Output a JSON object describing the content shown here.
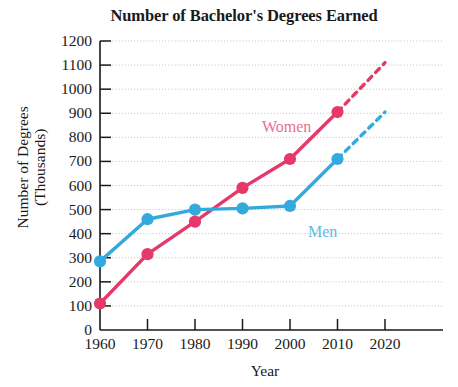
{
  "chart_data": {
    "type": "line",
    "title": "Number of Bachelor's Degrees Earned",
    "xlabel": "Year",
    "ylabel": "Number of Degrees\n(Thousands)",
    "ylabel_line1": "Number of Degrees",
    "ylabel_line2": "(Thousands)",
    "x": [
      1960,
      1970,
      1980,
      1990,
      2000,
      2010,
      2020
    ],
    "categories": [
      "1960",
      "1970",
      "1980",
      "1990",
      "2000",
      "2010",
      "2020"
    ],
    "xlim": [
      1960,
      2020
    ],
    "ylim": [
      0,
      1200
    ],
    "ytick_labels": [
      "0",
      "100",
      "200",
      "300",
      "400",
      "500",
      "600",
      "700",
      "800",
      "900",
      "1000",
      "1100",
      "1200"
    ],
    "ytick_values": [
      0,
      100,
      200,
      300,
      400,
      500,
      600,
      700,
      800,
      900,
      1000,
      1100,
      1200
    ],
    "xtick_labels": [
      "1960",
      "1970",
      "1980",
      "1990",
      "2000",
      "2010",
      "2020"
    ],
    "grid": "horizontal-dotted",
    "legend": "inline-series-labels",
    "series": [
      {
        "name": "Women",
        "color": "#e5396a",
        "dash_color": "#e5396a",
        "label_color": "#e8708f",
        "x": [
          1960,
          1970,
          1980,
          1990,
          2000,
          2010
        ],
        "values": [
          110,
          315,
          450,
          590,
          710,
          905
        ],
        "projected_x": [
          2010,
          2020
        ],
        "projected_values": [
          905,
          1110
        ],
        "projected_style": "dashed"
      },
      {
        "name": "Men",
        "color": "#34aadc",
        "dash_color": "#34aadc",
        "label_color": "#62b9e0",
        "x": [
          1960,
          1970,
          1980,
          1990,
          2000,
          2010
        ],
        "values": [
          285,
          460,
          500,
          505,
          515,
          710
        ],
        "projected_x": [
          2010,
          2020
        ],
        "projected_values": [
          710,
          905
        ],
        "projected_style": "dashed"
      }
    ],
    "annotations": [
      {
        "text": "Women",
        "x_px": 262,
        "y_px": 119
      },
      {
        "text": "Men",
        "x_px": 308,
        "y_px": 224
      }
    ]
  }
}
